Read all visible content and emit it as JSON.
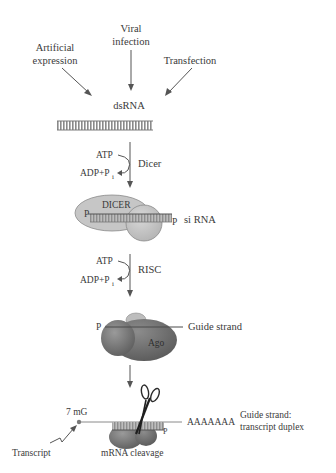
{
  "diagram": {
    "sources": {
      "artificial_line1": "Artificial",
      "artificial_line2": "expression",
      "viral_line1": "Viral",
      "viral_line2": "infection",
      "transfection": "Transfection"
    },
    "dsrna_label": "dsRNA",
    "step1": {
      "atp": "ATP",
      "adp": "ADP+P",
      "adp_sub": "i",
      "enzyme": "Dicer"
    },
    "dicer_complex": {
      "protein_label": "DICER",
      "p5": "P",
      "p3": "P",
      "product": "si RNA"
    },
    "step2": {
      "atp": "ATP",
      "adp": "ADP+P",
      "adp_sub": "i",
      "enzyme": "RISC"
    },
    "ago_complex": {
      "p_label": "P",
      "protein_label": "Ago",
      "guide_label": "Guide strand"
    },
    "cleavage": {
      "cap_label": "7 mG",
      "polyA": "AAAAAAA",
      "p_label": "P",
      "duplex_line1": "Guide strand:",
      "duplex_line2": "transcript duplex",
      "transcript_label": "Transcript",
      "cleavage_label": "mRNA cleavage"
    },
    "colors": {
      "text": "#3a3a3a",
      "arrow": "#555555",
      "protein_light": "#c8c8c8",
      "protein_dark": "#7a7a7a",
      "rna_bar": "#9a9a9a"
    }
  }
}
